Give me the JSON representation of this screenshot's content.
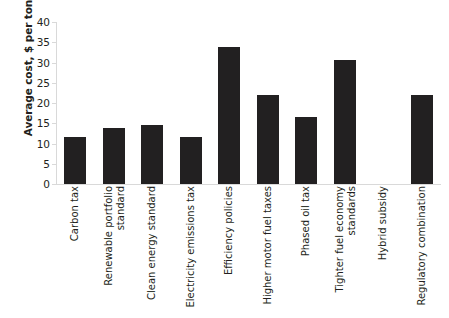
{
  "chart_data": {
    "type": "bar",
    "title": "",
    "xlabel": "",
    "ylabel": "Average cost, $ per ton",
    "ylim": [
      0,
      40
    ],
    "yticks": [
      0,
      5,
      10,
      15,
      20,
      25,
      30,
      35,
      40
    ],
    "grid": false,
    "legend": null,
    "bar_color": "#222021",
    "axis_color": "#d9d9d9",
    "categories": [
      "Carbon tax",
      "Renewable portfolio standard",
      "Clean energy standard",
      "Electricity emissions tax",
      "Efficiency policies",
      "Higher motor fuel taxes",
      "Phased oil tax",
      "Tighter fuel economy standards",
      "Hybrid subsidy",
      "Regulatory combination"
    ],
    "category_lines": [
      [
        "Carbon tax"
      ],
      [
        "Renewable portfolio",
        "standard"
      ],
      [
        "Clean energy standard"
      ],
      [
        "Electricity emissions tax"
      ],
      [
        "Efficiency policies"
      ],
      [
        "Higher motor fuel taxes"
      ],
      [
        "Phased oil tax"
      ],
      [
        "Tighter fuel economy",
        "standards"
      ],
      [
        "Hybrid subsidy"
      ],
      [
        "Regulatory combination"
      ]
    ],
    "values": [
      11.7,
      13.8,
      14.6,
      11.6,
      33.8,
      22.0,
      16.5,
      30.7,
      0,
      22.0
    ]
  }
}
